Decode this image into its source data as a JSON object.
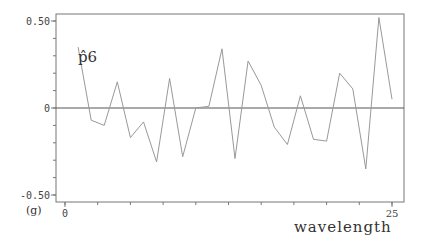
{
  "chart_data": {
    "type": "line",
    "title": "",
    "panel_label": "(g)",
    "series_label": "p̂6",
    "xlabel": "wavelength",
    "ylabel": "",
    "xlim": [
      0,
      26
    ],
    "ylim": [
      -0.55,
      0.55
    ],
    "x_ticks": [
      0,
      25
    ],
    "x_tick_labels": [
      "0",
      "25"
    ],
    "y_ticks": [
      0.5,
      0,
      -0.5
    ],
    "y_tick_labels": [
      "0.50",
      "0",
      "-0.50"
    ],
    "grid": false,
    "reference_line_y": 0,
    "legend": "none",
    "series": [
      {
        "name": "p̂6",
        "x": [
          1,
          2,
          3,
          4,
          5,
          6,
          7,
          8,
          9,
          10,
          11,
          12,
          13,
          14,
          15,
          16,
          17,
          18,
          19,
          20,
          21,
          22,
          23,
          24,
          25
        ],
        "values": [
          0.35,
          -0.07,
          -0.1,
          0.15,
          -0.17,
          -0.08,
          -0.31,
          0.17,
          -0.28,
          0.0,
          0.01,
          0.34,
          -0.29,
          0.27,
          0.13,
          -0.11,
          -0.21,
          0.07,
          -0.18,
          -0.19,
          0.2,
          0.11,
          -0.35,
          0.52,
          0.05
        ]
      }
    ]
  },
  "colors": {
    "axis": "#777777",
    "line": "#999999",
    "zero_line": "#555555",
    "text": "#333333"
  }
}
